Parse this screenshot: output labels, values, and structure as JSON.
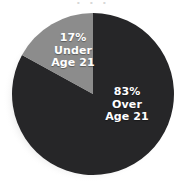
{
  "chart_data": {
    "type": "pie",
    "title": "",
    "cropped_title_fragment": "· · ·",
    "categories": [
      "Over Age 21",
      "Under Age 21"
    ],
    "values": [
      83,
      17
    ],
    "value_unit": "%",
    "legend": "none",
    "slices": [
      {
        "name": "over-age-21",
        "percent": "83%",
        "label_line1": "Over",
        "label_line2": "Age 21",
        "value": 83,
        "color": "#262628",
        "start_angle_deg": 0,
        "end_angle_deg": 298.8
      },
      {
        "name": "under-age-21",
        "percent": "17%",
        "label_line1": "Under",
        "label_line2": "Age 21",
        "value": 17,
        "color": "#8c8c8c",
        "start_angle_deg": 298.8,
        "end_angle_deg": 360
      }
    ]
  },
  "colors": {
    "background": "#ffffff",
    "slice_dark": "#262628",
    "slice_gray": "#8c8c8c",
    "label_text": "#ffffff",
    "shadow": "#d5d5d5"
  },
  "geometry": {
    "center_x": 93,
    "center_y": 94,
    "radius": 81
  }
}
